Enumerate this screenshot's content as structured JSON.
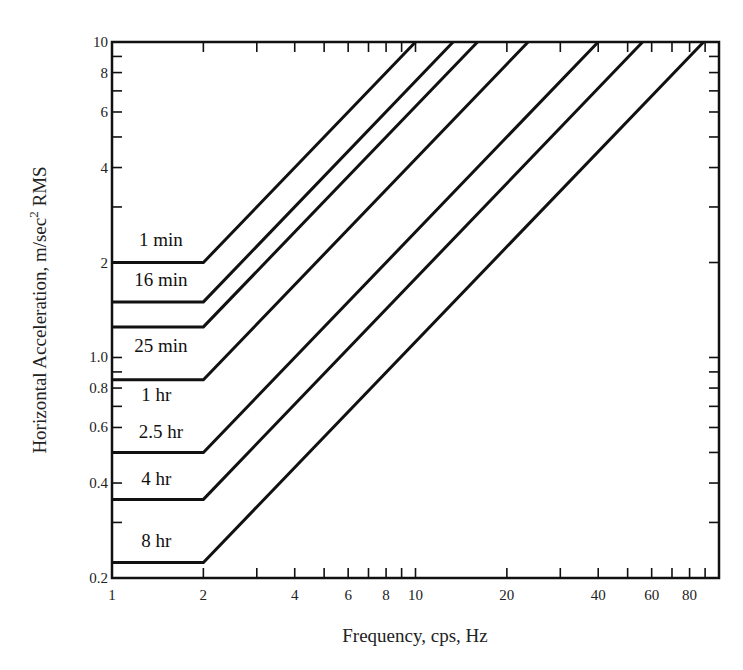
{
  "chart_data": {
    "type": "line",
    "title": "",
    "xlabel": "Frequency, cps, Hz",
    "ylabel": "Horizontal Acceleration, m/sec² RMS",
    "ylabel_parts": {
      "main": "Horizontal Acceleration, m/sec",
      "sup": "2",
      "tail": " RMS"
    },
    "x_scale": "log",
    "y_scale": "log",
    "xlim": [
      1,
      100
    ],
    "ylim": [
      0.2,
      10
    ],
    "grid": false,
    "legend": "none (curves labelled inline)",
    "x_ticks": [
      1,
      2,
      3,
      4,
      5,
      6,
      7,
      8,
      9,
      10,
      20,
      30,
      40,
      50,
      60,
      70,
      80,
      90
    ],
    "x_tick_labels": [
      {
        "value": 1,
        "label": "1"
      },
      {
        "value": 2,
        "label": "2"
      },
      {
        "value": 4,
        "label": "4"
      },
      {
        "value": 6,
        "label": "6"
      },
      {
        "value": 8,
        "label": "8"
      },
      {
        "value": 10,
        "label": "10"
      },
      {
        "value": 20,
        "label": "20"
      },
      {
        "value": 40,
        "label": "40"
      },
      {
        "value": 60,
        "label": "60"
      },
      {
        "value": 80,
        "label": "80"
      }
    ],
    "y_ticks": [
      0.2,
      0.3,
      0.4,
      0.5,
      0.6,
      0.7,
      0.8,
      0.9,
      1,
      2,
      3,
      4,
      5,
      6,
      7,
      8,
      9,
      10
    ],
    "y_tick_labels": [
      {
        "value": 0.2,
        "label": "0.2"
      },
      {
        "value": 0.4,
        "label": "0.4"
      },
      {
        "value": 0.6,
        "label": "0.6"
      },
      {
        "value": 0.8,
        "label": "0.8"
      },
      {
        "value": 1.0,
        "label": "1.0"
      },
      {
        "value": 2,
        "label": "2"
      },
      {
        "value": 4,
        "label": "4"
      },
      {
        "value": 6,
        "label": "6"
      },
      {
        "value": 8,
        "label": "8"
      },
      {
        "value": 10,
        "label": "10"
      }
    ],
    "series": [
      {
        "name": "1 min",
        "flat_level": 2.0,
        "corner_freq": 2,
        "x": [
          1,
          2,
          10
        ],
        "y": [
          2.0,
          2.0,
          10
        ],
        "label_pos": {
          "x": 1.45,
          "y": 2.25,
          "anchor": "middle"
        }
      },
      {
        "name": "16 min",
        "flat_level": 1.5,
        "corner_freq": 2,
        "x": [
          1,
          2,
          13.3
        ],
        "y": [
          1.5,
          1.5,
          10
        ],
        "label_pos": {
          "x": 1.45,
          "y": 1.68,
          "anchor": "middle"
        }
      },
      {
        "name": "25 min",
        "flat_level": 1.25,
        "corner_freq": 2,
        "x": [
          1,
          2,
          16
        ],
        "y": [
          1.25,
          1.25,
          10
        ],
        "label_pos": {
          "x": 1.45,
          "y": 1.04,
          "anchor": "middle"
        }
      },
      {
        "name": "1 hr",
        "flat_level": 0.85,
        "corner_freq": 2,
        "x": [
          1,
          2,
          23.5
        ],
        "y": [
          0.85,
          0.85,
          10
        ],
        "label_pos": {
          "x": 1.4,
          "y": 0.73,
          "anchor": "middle"
        }
      },
      {
        "name": "2.5 hr",
        "flat_level": 0.5,
        "corner_freq": 2,
        "x": [
          1,
          2,
          40
        ],
        "y": [
          0.5,
          0.5,
          10
        ],
        "label_pos": {
          "x": 1.45,
          "y": 0.555,
          "anchor": "middle"
        }
      },
      {
        "name": "4 hr",
        "flat_level": 0.355,
        "corner_freq": 2,
        "x": [
          1,
          2,
          56
        ],
        "y": [
          0.355,
          0.355,
          10
        ],
        "label_pos": {
          "x": 1.4,
          "y": 0.395,
          "anchor": "middle"
        }
      },
      {
        "name": "8 hr",
        "flat_level": 0.224,
        "corner_freq": 2,
        "x": [
          1,
          2,
          89
        ],
        "y": [
          0.224,
          0.224,
          10
        ],
        "label_pos": {
          "x": 1.4,
          "y": 0.25,
          "anchor": "middle"
        }
      }
    ],
    "annotations": [
      "Curves are constant acceleration from 1–2 Hz, then rise proportionally to frequency (slope 1 on log-log)"
    ]
  },
  "layout": {
    "plot": {
      "left": 112,
      "right": 719,
      "top": 42,
      "bottom": 578
    },
    "colors": {
      "line": "#111111",
      "text": "#222222",
      "background": "#ffffff"
    }
  }
}
